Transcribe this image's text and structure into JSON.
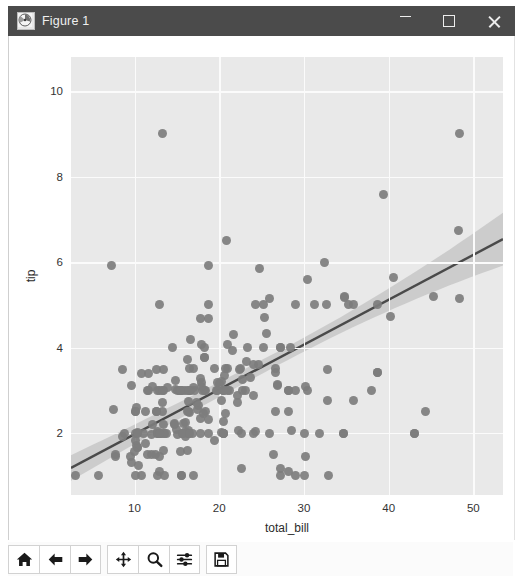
{
  "window": {
    "title": "Figure 1",
    "icon": "matplotlib-icon",
    "minimize_label": "—",
    "maximize_label": "□",
    "close_label": "✕"
  },
  "toolbar": {
    "buttons": [
      {
        "name": "home-button",
        "icon": "home-icon",
        "tooltip": "Reset original view"
      },
      {
        "name": "back-button",
        "icon": "arrow-left-icon",
        "tooltip": "Back to previous view"
      },
      {
        "name": "forward-button",
        "icon": "arrow-right-icon",
        "tooltip": "Forward to next view"
      },
      {
        "name": "pan-button",
        "icon": "move-arrows-icon",
        "tooltip": "Pan axes with left mouse, zoom with right"
      },
      {
        "name": "zoom-button",
        "icon": "magnifier-icon",
        "tooltip": "Zoom to rectangle"
      },
      {
        "name": "configure-subplots-button",
        "icon": "sliders-icon",
        "tooltip": "Configure subplots"
      },
      {
        "name": "save-button",
        "icon": "floppy-disk-icon",
        "tooltip": "Save the figure"
      }
    ]
  },
  "colors": {
    "titlebar_bg": "#4b4b4b",
    "plot_bg": "#e9e9e9",
    "grid": "#fbfbfb",
    "point": "#7d7d7d",
    "line": "#4a4a4a",
    "band": "#b4b4b4"
  },
  "chart_data": {
    "type": "scatter",
    "title": "",
    "xlabel": "total_bill",
    "ylabel": "tip",
    "xlim": [
      2.5,
      53.5
    ],
    "ylim": [
      0.55,
      10.8
    ],
    "xticks": [
      10,
      20,
      30,
      40,
      50
    ],
    "yticks": [
      2,
      4,
      6,
      8,
      10
    ],
    "grid": true,
    "legend": null,
    "regression": {
      "show": true,
      "slope": 0.105,
      "intercept": 0.92,
      "ci": 95,
      "ci_halfwidth_at_xmin": 0.3,
      "ci_halfwidth_at_xmid": 0.16,
      "ci_halfwidth_at_xmax": 0.62
    },
    "x": [
      16.99,
      10.34,
      21.01,
      23.68,
      24.59,
      25.29,
      8.77,
      26.88,
      15.04,
      14.78,
      10.27,
      35.26,
      15.42,
      18.43,
      14.83,
      21.58,
      10.33,
      16.29,
      16.97,
      20.65,
      17.92,
      20.29,
      15.77,
      39.42,
      19.82,
      17.81,
      13.37,
      12.69,
      21.7,
      19.65,
      9.55,
      18.35,
      15.06,
      20.69,
      17.78,
      24.06,
      16.31,
      16.93,
      18.69,
      31.27,
      16.04,
      17.46,
      13.94,
      9.68,
      30.4,
      18.29,
      22.23,
      32.4,
      28.55,
      18.04,
      12.54,
      10.29,
      34.81,
      9.94,
      25.56,
      19.49,
      38.01,
      26.41,
      11.24,
      48.27,
      20.29,
      13.81,
      11.02,
      18.29,
      17.59,
      20.08,
      16.45,
      3.07,
      20.23,
      15.01,
      12.02,
      17.07,
      26.86,
      25.28,
      14.73,
      10.51,
      17.92,
      27.2,
      22.76,
      17.29,
      19.44,
      16.66,
      10.07,
      32.68,
      15.98,
      34.83,
      13.03,
      18.28,
      24.71,
      21.16,
      28.97,
      22.49,
      5.75,
      16.32,
      22.75,
      40.17,
      27.28,
      12.03,
      21.01,
      12.46,
      11.35,
      15.38,
      44.3,
      22.42,
      20.92,
      15.36,
      20.49,
      25.21,
      18.24,
      14.76,
      16.32,
      16.4,
      20.53,
      16.47,
      26.59,
      38.73,
      24.27,
      12.76,
      30.06,
      25.89,
      48.33,
      13.27,
      28.17,
      12.9,
      28.15,
      11.59,
      7.74,
      30.14,
      12.16,
      13.42,
      8.58,
      15.98,
      13.42,
      16.27,
      10.09,
      20.45,
      13.28,
      22.12,
      24.01,
      15.69,
      11.61,
      10.77,
      15.53,
      10.07,
      12.6,
      32.83,
      35.83,
      29.03,
      27.18,
      22.67,
      17.82,
      18.78,
      10.34,
      43.11,
      13.0,
      13.51,
      18.71,
      12.74,
      13.0,
      16.4,
      20.53,
      16.47,
      26.59,
      38.73,
      24.27,
      12.76,
      30.06,
      25.89,
      48.33,
      13.27,
      28.17,
      12.9,
      28.15,
      11.59,
      7.74,
      30.14,
      12.16,
      13.42,
      8.58,
      15.98,
      13.42,
      16.27,
      10.09,
      20.45,
      13.28,
      22.12,
      24.01,
      15.69,
      11.61,
      10.77,
      15.53,
      10.07,
      12.6,
      32.83,
      35.83,
      29.03,
      27.18,
      22.67,
      17.82,
      18.78,
      7.25,
      31.85,
      16.82,
      32.9,
      17.89,
      14.48,
      9.6,
      34.63,
      34.65,
      23.33,
      45.35,
      23.17,
      40.55,
      20.69,
      20.9,
      30.46,
      18.15,
      23.1,
      15.69,
      19.81,
      28.44,
      15.48,
      16.58,
      7.56,
      10.34,
      43.11,
      13.0,
      13.51,
      18.71,
      12.74,
      13.0,
      16.4,
      20.53,
      16.47,
      26.59,
      38.73
    ],
    "y": [
      1.01,
      1.66,
      3.5,
      3.31,
      3.61,
      4.71,
      2.0,
      3.12,
      1.96,
      3.23,
      1.71,
      5.0,
      1.57,
      3.0,
      3.02,
      3.92,
      1.67,
      3.71,
      3.5,
      3.35,
      4.08,
      2.75,
      2.23,
      7.58,
      3.18,
      2.34,
      2.0,
      2.0,
      4.3,
      3.0,
      1.45,
      2.5,
      3.0,
      2.45,
      3.27,
      3.6,
      2.0,
      3.07,
      2.31,
      5.0,
      2.24,
      2.54,
      3.06,
      1.32,
      5.6,
      3.0,
      2.05,
      6.0,
      2.05,
      3.0,
      2.5,
      2.6,
      5.2,
      1.56,
      4.34,
      3.51,
      3.0,
      1.5,
      1.76,
      6.73,
      3.21,
      2.0,
      1.98,
      3.76,
      2.64,
      3.15,
      2.47,
      1.0,
      2.01,
      2.09,
      1.97,
      3.0,
      3.14,
      5.0,
      2.2,
      1.25,
      3.08,
      4.0,
      3.0,
      2.71,
      1.83,
      3.0,
      1.83,
      5.0,
      2.03,
      5.17,
      2.0,
      4.0,
      5.85,
      3.0,
      3.0,
      3.5,
      1.0,
      2.05,
      3.25,
      4.73,
      4.0,
      1.5,
      3.0,
      1.5,
      2.5,
      3.0,
      2.5,
      3.48,
      4.08,
      3.0,
      2.28,
      4.0,
      3.76,
      2.23,
      2.73,
      2.5,
      3.0,
      3.5,
      3.41,
      5.0,
      2.03,
      1.0,
      2.0,
      5.16,
      9.0,
      2.5,
      3.0,
      1.1,
      3.0,
      1.5,
      1.44,
      3.09,
      2.2,
      3.48,
      1.92,
      3.0,
      1.58,
      2.5,
      2.0,
      3.0,
      2.72,
      2.88,
      2.0,
      3.0,
      3.39,
      1.0,
      1.0,
      2.5,
      3.48,
      2.75,
      5.0,
      1.0,
      1.17,
      2.0,
      4.67,
      5.92,
      2.0,
      2.0,
      5.0,
      2.0,
      2.0,
      3.0,
      2.0,
      2.0,
      2.0,
      3.0,
      3.5,
      3.41,
      5.0,
      2.03,
      1.0,
      2.0,
      5.16,
      9.0,
      2.5,
      3.0,
      1.1,
      3.0,
      1.5,
      1.44,
      3.09,
      2.2,
      3.48,
      1.92,
      3.0,
      1.58,
      2.5,
      2.0,
      3.0,
      2.72,
      2.88,
      2.0,
      3.0,
      3.39,
      1.0,
      1.0,
      2.5,
      3.48,
      2.75,
      5.0,
      1.0,
      1.17,
      2.0,
      4.67,
      5.92,
      2.0,
      2.0,
      1.0,
      3.18,
      4.0,
      3.11,
      2.0,
      2.0,
      4.0,
      5.2,
      3.68,
      5.65,
      3.5,
      6.5,
      3.0,
      2.45,
      3.0,
      2.0,
      3.0,
      4.0,
      3.0,
      4.19,
      2.56,
      2.02,
      2.0,
      1.44,
      1.0,
      5.0,
      2.0,
      2.0,
      3.0,
      2.0,
      2.0,
      2.5,
      3.41,
      5.0,
      2.03,
      3.0
    ],
    "point_count": 244,
    "n_unique_shown": 244
  }
}
